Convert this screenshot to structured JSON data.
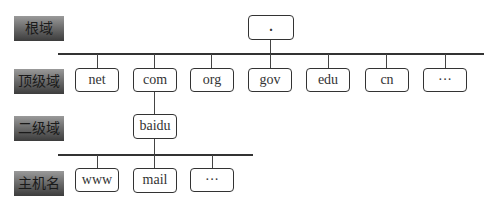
{
  "levels": {
    "root": "根域",
    "tld": "顶级域",
    "second": "二级域",
    "host": "主机名"
  },
  "root_node": {
    "label": "."
  },
  "tld_nodes": [
    {
      "label": "net"
    },
    {
      "label": "com"
    },
    {
      "label": "org"
    },
    {
      "label": "gov"
    },
    {
      "label": "edu"
    },
    {
      "label": "cn"
    },
    {
      "label": "···"
    }
  ],
  "second_node": {
    "label": "baidu"
  },
  "host_nodes": [
    {
      "label": "www"
    },
    {
      "label": "mail"
    },
    {
      "label": "···"
    }
  ],
  "colors": {
    "label_bg_top": "#9a9a9a",
    "label_bg_bottom": "#3c3c3c",
    "line": "#333333"
  }
}
